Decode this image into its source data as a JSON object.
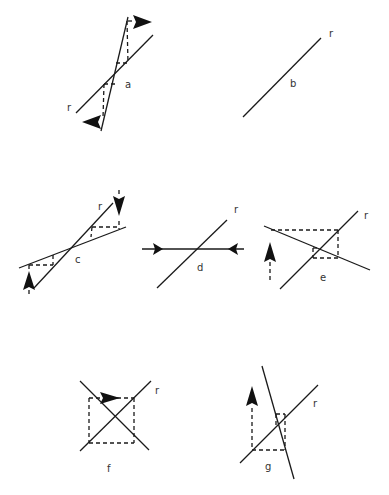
{
  "figure": {
    "line_label": "r",
    "panels": [
      {
        "id": "a",
        "label": "a",
        "description": "two lines crossing at acute angle, dashed projections with left and right arrowheads"
      },
      {
        "id": "b",
        "label": "b",
        "description": "single diagonal line r"
      },
      {
        "id": "c",
        "label": "c",
        "description": "two lines crossing at shallow angle, dashed projections with vertical arrows up and down"
      },
      {
        "id": "d",
        "label": "d",
        "description": "diagonal line r crossed by horizontal line with arrowheads pointing inward"
      },
      {
        "id": "e",
        "label": "e",
        "description": "line r crossed by descending line, dashed rectangle with upward arrow"
      },
      {
        "id": "f",
        "label": "f",
        "description": "perpendicular X lines with dashed square, rightward arrow on top edge"
      },
      {
        "id": "g",
        "label": "g",
        "description": "line r crossed by steep line, dashed rectangle with upward arrow"
      }
    ]
  }
}
